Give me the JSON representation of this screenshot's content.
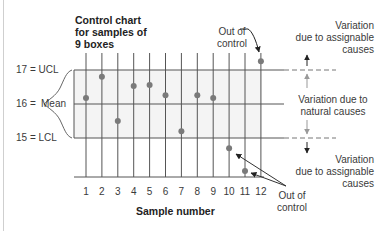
{
  "chart_data": {
    "type": "scatter",
    "title": "Control chart for samples of 9 boxes",
    "xlabel": "Sample number",
    "ylabel": "",
    "x": [
      1,
      2,
      3,
      4,
      5,
      6,
      7,
      8,
      9,
      10,
      11,
      12
    ],
    "categories": [
      "1",
      "2",
      "3",
      "4",
      "5",
      "6",
      "7",
      "8",
      "9",
      "10",
      "11",
      "12"
    ],
    "series": [
      {
        "name": "Sample mean",
        "values": [
          16.18,
          16.8,
          15.5,
          16.53,
          16.56,
          16.26,
          15.2,
          16.26,
          16.18,
          14.7,
          14.03,
          17.26
        ]
      }
    ],
    "control_limits": {
      "UCL": 17,
      "Mean": 16,
      "LCL": 15
    },
    "ylim": [
      14,
      17.5
    ],
    "grid": true,
    "legend": "none",
    "annotations": [
      "Out of control (sample 12)",
      "Out of control (samples 10, 11)",
      "Variation due to assignable causes (above UCL)",
      "Variation due to natural causes (between UCL and LCL)",
      "Variation due to assignable causes (below LCL)"
    ]
  },
  "labels": {
    "title": "Control chart\nfor samples of\n9 boxes",
    "ucl": "17 = UCL",
    "mean_prefix": "16 =",
    "mean_word": "Mean",
    "lcl": "15 = LCL",
    "xlabel": "Sample number",
    "out_of_control_top_1": "Out of",
    "out_of_control_top_2": "control",
    "out_of_control_bottom_1": "Out of",
    "out_of_control_bottom_2": "control",
    "assignable_top_1": "Variation",
    "assignable_top_2": "due to assignable",
    "assignable_top_3": "causes",
    "natural_1": "Variation due to",
    "natural_2": "natural causes",
    "assignable_bottom_1": "Variation",
    "assignable_bottom_2": "due to assignable",
    "assignable_bottom_3": "causes"
  },
  "ticks": [
    "1",
    "2",
    "3",
    "4",
    "5",
    "6",
    "7",
    "8",
    "9",
    "10",
    "11",
    "12"
  ],
  "colors": {
    "line": "#555555",
    "point": "#7a7a7a",
    "band": "#f4f4f4",
    "text": "#333333"
  }
}
